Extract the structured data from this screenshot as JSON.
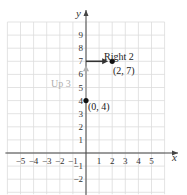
{
  "chart_data": {
    "type": "scatter",
    "title": "",
    "xlabel": "x",
    "ylabel": "y",
    "xlim": [
      -6,
      6
    ],
    "ylim": [
      -3,
      10
    ],
    "grid": true,
    "x_ticks": [
      -5,
      -4,
      -3,
      -2,
      -1,
      1,
      2,
      3,
      4,
      5
    ],
    "y_ticks": [
      -2,
      -1,
      1,
      2,
      3,
      4,
      5,
      6,
      7,
      8,
      9
    ],
    "points": [
      {
        "x": 0,
        "y": 4,
        "label": "(0, 4)"
      },
      {
        "x": 2,
        "y": 7,
        "label": "(2, 7)"
      }
    ],
    "annotations": [
      {
        "text": "Up 3",
        "from": [
          0,
          4
        ],
        "to": [
          0,
          7
        ],
        "color": "#b0b0b0"
      },
      {
        "text": "Right 2",
        "from": [
          0,
          7
        ],
        "to": [
          2,
          7
        ],
        "color": "#333333"
      }
    ]
  },
  "labels": {
    "x_axis": "x",
    "y_axis": "y",
    "up": "Up 3",
    "right": "Right 2",
    "p1": "(0, 4)",
    "p2": "(2, 7)"
  },
  "colors": {
    "grid": "#dcdcdc",
    "axis": "#444444",
    "up_arrow": "#b0b0b0",
    "right_arrow": "#333333",
    "point": "#111111"
  }
}
